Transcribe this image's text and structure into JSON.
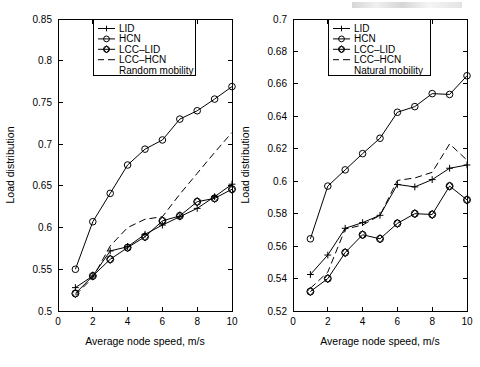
{
  "figure": {
    "title": "",
    "panels": [
      "left",
      "right"
    ]
  },
  "chart_data": [
    {
      "type": "line",
      "title": "",
      "subtitle": "Random mobility",
      "panel": "left",
      "xlabel": "Average node speed, m/s",
      "ylabel": "Load distribution",
      "xlim": [
        0,
        10
      ],
      "ylim": [
        0.5,
        0.85
      ],
      "xticks": [
        0,
        2,
        4,
        6,
        8,
        10
      ],
      "xticklabels": [
        "0",
        "2",
        "4",
        "6",
        "8",
        "10"
      ],
      "yticks": [
        0.5,
        0.55,
        0.6,
        0.65,
        0.7,
        0.75,
        0.8,
        0.85
      ],
      "yticklabels": [
        "0.5",
        "0.55",
        "0.6",
        "0.65",
        "0.7",
        "0.75",
        "0.8",
        "0.85"
      ],
      "grid": false,
      "legend_position": "upper-left",
      "legend_entries": [
        "LID",
        "HCN",
        "LCC–LID",
        "LCC–HCN",
        "Random mobility"
      ],
      "x": [
        1,
        2,
        3,
        4,
        5,
        6,
        7,
        8,
        9,
        10
      ],
      "series": [
        {
          "name": "LID",
          "marker": "plus",
          "style": "solid",
          "values": [
            0.528,
            0.542,
            0.572,
            0.577,
            0.592,
            0.603,
            0.613,
            0.623,
            0.637,
            0.652
          ]
        },
        {
          "name": "HCN",
          "marker": "circle",
          "style": "solid",
          "values": [
            0.55,
            0.607,
            0.641,
            0.675,
            0.694,
            0.705,
            0.73,
            0.74,
            0.754,
            0.769
          ]
        },
        {
          "name": "LCC–LID",
          "marker": "diamond-circle",
          "style": "solid",
          "values": [
            0.521,
            0.542,
            0.562,
            0.576,
            0.589,
            0.608,
            0.614,
            0.631,
            0.635,
            0.646
          ]
        },
        {
          "name": "LCC–HCN",
          "marker": "none",
          "style": "dashed",
          "values": [
            0.519,
            0.54,
            0.578,
            0.6,
            0.61,
            0.613,
            0.64,
            0.665,
            0.69,
            0.714
          ]
        }
      ]
    },
    {
      "type": "line",
      "title": "",
      "subtitle": "Natural mobility",
      "panel": "right",
      "xlabel": "Average node speed, m/s",
      "ylabel": "Load distribution",
      "xlim": [
        0,
        10
      ],
      "ylim": [
        0.52,
        0.7
      ],
      "xticks": [
        0,
        2,
        4,
        6,
        8,
        10
      ],
      "xticklabels": [
        "0",
        "2",
        "4",
        "6",
        "8",
        "10"
      ],
      "yticks": [
        0.52,
        0.54,
        0.56,
        0.58,
        0.6,
        0.62,
        0.64,
        0.66,
        0.68,
        0.7
      ],
      "yticklabels": [
        "0.52",
        "0.54",
        "0.56",
        "0.58",
        "0.6",
        "0.62",
        "0.64",
        "0.66",
        "0.68",
        "0.7"
      ],
      "grid": false,
      "legend_position": "upper-left",
      "legend_entries": [
        "LID",
        "HCN",
        "LCC–LID",
        "LCC–HCN",
        "Natural mobility"
      ],
      "x": [
        1,
        2,
        3,
        4,
        5,
        6,
        7,
        8,
        9,
        10
      ],
      "series": [
        {
          "name": "LID",
          "marker": "plus",
          "style": "solid",
          "values": [
            0.5425,
            0.5545,
            0.571,
            0.5745,
            0.579,
            0.598,
            0.5965,
            0.601,
            0.608,
            0.61
          ]
        },
        {
          "name": "HCN",
          "marker": "circle",
          "style": "solid",
          "values": [
            0.5645,
            0.597,
            0.607,
            0.617,
            0.6265,
            0.6425,
            0.646,
            0.654,
            0.6535,
            0.665
          ]
        },
        {
          "name": "LCC–LID",
          "marker": "diamond-circle",
          "style": "solid",
          "values": [
            0.532,
            0.54,
            0.556,
            0.567,
            0.5645,
            0.574,
            0.58,
            0.5795,
            0.597,
            0.5885
          ]
        },
        {
          "name": "LCC–HCN",
          "marker": "none",
          "style": "dashed",
          "values": [
            0.534,
            0.544,
            0.5705,
            0.573,
            0.579,
            0.6005,
            0.602,
            0.6055,
            0.623,
            0.613
          ]
        }
      ]
    }
  ]
}
